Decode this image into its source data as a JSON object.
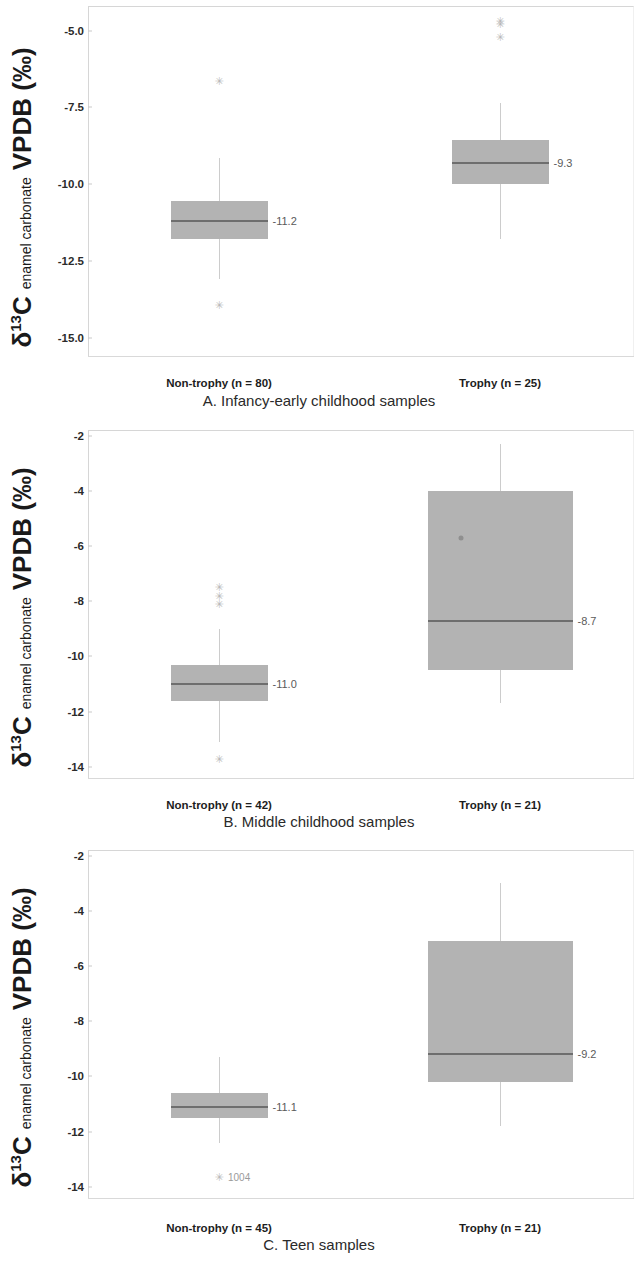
{
  "figure": {
    "axis_title_symbol": "δ",
    "axis_title_sup": "13",
    "axis_title_element": "C",
    "axis_title_mid": "enamel carbonate",
    "axis_title_units": "VPDB (‰)",
    "box_fill_color": "#b3b3b3",
    "median_color": "#6e6e6e",
    "whisker_color": "#cccccc",
    "outlier_glyph": "✳",
    "outlier_glyph_x": "×"
  },
  "chart_data": [
    {
      "type": "box",
      "panel": "A",
      "title": "A. Infancy-early childhood samples",
      "xlabel": "",
      "ylabel": "δ13C enamel carbonate VPDB (‰)",
      "ylim": [
        -15.6,
        -4.2
      ],
      "yticks": [
        "-5.0",
        "-7.5",
        "-10.0",
        "-12.5",
        "-15.0"
      ],
      "ytickvalues": [
        -5.0,
        -7.5,
        -10.0,
        -12.5,
        -15.0
      ],
      "grid": false,
      "legend": "none",
      "categories": [
        "Non-trophy (n = 80)",
        "Trophy (n = 25)"
      ],
      "boxes": [
        {
          "category": "Non-trophy (n = 80)",
          "n": 80,
          "q3": -10.55,
          "median": -11.2,
          "q1": -11.8,
          "whisker_high": -9.15,
          "whisker_low": -13.1,
          "median_label": "-11.2",
          "outliers": [
            -6.65,
            -13.95
          ],
          "outlier_labels": []
        },
        {
          "category": "Trophy (n = 25)",
          "n": 25,
          "q3": -8.55,
          "median": -9.3,
          "q1": -10.0,
          "whisker_high": -7.35,
          "whisker_low": -11.8,
          "median_label": "-9.3",
          "outliers": [
            -4.7,
            -4.8,
            -5.2
          ],
          "outlier_labels": []
        }
      ]
    },
    {
      "type": "box",
      "panel": "B",
      "title": "B. Middle childhood samples",
      "xlabel": "",
      "ylabel": "δ13C enamel carbonate VPDB (‰)",
      "ylim": [
        -14.4,
        -1.8
      ],
      "yticks": [
        "-2",
        "-4",
        "-6",
        "-8",
        "-10",
        "-12",
        "-14"
      ],
      "ytickvalues": [
        -2,
        -4,
        -6,
        -8,
        -10,
        -12,
        -14
      ],
      "grid": false,
      "legend": "none",
      "categories": [
        "Non-trophy (n = 42)",
        "Trophy (n = 21)"
      ],
      "boxes": [
        {
          "category": "Non-trophy (n = 42)",
          "n": 42,
          "q3": -10.3,
          "median": -11.0,
          "q1": -11.6,
          "whisker_high": -9.0,
          "whisker_low": -13.1,
          "median_label": "-11.0",
          "outliers": [
            -7.5,
            -7.8,
            -8.1,
            -13.7
          ],
          "outlier_labels": []
        },
        {
          "category": "Trophy (n = 21)",
          "n": 21,
          "q3": -4.0,
          "median": -8.7,
          "q1": -10.5,
          "whisker_high": -2.3,
          "whisker_low": -11.7,
          "median_label": "-8.7",
          "outliers": [],
          "outlier_dots": [
            -5.7
          ],
          "outlier_labels": []
        }
      ]
    },
    {
      "type": "box",
      "panel": "C",
      "title": "C. Teen samples",
      "xlabel": "",
      "ylabel": "δ13C enamel carbonate VPDB (‰)",
      "ylim": [
        -14.4,
        -1.8
      ],
      "yticks": [
        "-2",
        "-4",
        "-6",
        "-8",
        "-10",
        "-12",
        "-14"
      ],
      "ytickvalues": [
        -2,
        -4,
        -6,
        -8,
        -10,
        -12,
        -14
      ],
      "grid": false,
      "legend": "none",
      "categories": [
        "Non-trophy (n = 45)",
        "Trophy (n = 21)"
      ],
      "boxes": [
        {
          "category": "Non-trophy (n = 45)",
          "n": 45,
          "q3": -10.6,
          "median": -11.1,
          "q1": -11.5,
          "whisker_high": -9.3,
          "whisker_low": -12.4,
          "median_label": "-11.1",
          "outliers": [
            -13.65
          ],
          "outlier_labels": [
            {
              "value": -13.65,
              "text": "1004"
            }
          ]
        },
        {
          "category": "Trophy (n = 21)",
          "n": 21,
          "q3": -5.1,
          "median": -9.2,
          "q1": -10.2,
          "whisker_high": -3.0,
          "whisker_low": -11.8,
          "median_label": "-9.2",
          "outliers": [],
          "outlier_labels": []
        }
      ]
    }
  ]
}
